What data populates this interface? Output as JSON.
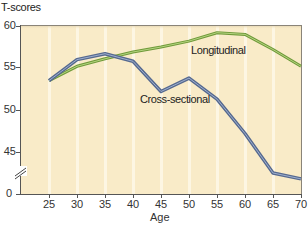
{
  "chart_data": {
    "type": "line",
    "title": "",
    "ylabel": "T-scores",
    "xlabel": "Age",
    "x": [
      25,
      30,
      35,
      40,
      45,
      50,
      55,
      60,
      65,
      70
    ],
    "y_ticks": [
      "60",
      "55",
      "50",
      "45",
      "0"
    ],
    "x_ticks": [
      "25",
      "30",
      "35",
      "40",
      "45",
      "50",
      "55",
      "60",
      "65",
      "70"
    ],
    "ylim": [
      0,
      60
    ],
    "y_axis_break": "between 0 and 45",
    "grid": "vertical light bands",
    "legend_position": "inline labels",
    "series": [
      {
        "name": "Longitudinal",
        "color": "#86b04a",
        "values": [
          53.5,
          55.2,
          56.1,
          56.9,
          57.5,
          58.2,
          59.2,
          59.0,
          57.2,
          55.2
        ]
      },
      {
        "name": "Cross-sectional",
        "color": "#5b6f95",
        "values": [
          53.5,
          56.0,
          56.7,
          55.8,
          52.2,
          53.8,
          51.3,
          47.2,
          42.5,
          41.8
        ]
      }
    ]
  },
  "labels": {
    "ylabel": "T-scores",
    "xlabel": "Age",
    "longitudinal": "Longitudinal",
    "cross_sectional": "Cross-sectional",
    "y60": "60",
    "y55": "55",
    "y50": "50",
    "y45": "45",
    "y0": "0",
    "x25": "25",
    "x30": "30",
    "x35": "35",
    "x40": "40",
    "x45": "45",
    "x50": "50",
    "x55": "55",
    "x60": "60",
    "x65": "65",
    "x70": "70"
  },
  "colors": {
    "plot_bg": "#f9ebc8",
    "band": "#fdf6e3",
    "longitudinal": "#86b04a",
    "cross_sectional": "#5b6f95",
    "axis": "#555555"
  }
}
